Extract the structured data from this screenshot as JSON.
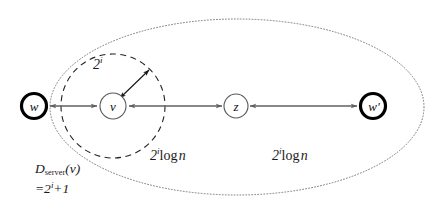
{
  "figure": {
    "colors": {
      "stroke_bold": "#000000",
      "stroke_thin": "#555555",
      "edge": "#606060",
      "dashed_circle": "#222222",
      "dotted_ellipse": "#7a7a7a",
      "text": "#111111",
      "background": "#ffffff"
    }
  },
  "nodes": [
    {
      "id": "w",
      "label": "w",
      "style": "bold",
      "cx": 34,
      "cy": 106,
      "r": 13
    },
    {
      "id": "v",
      "label": "v",
      "style": "thin",
      "cx": 113,
      "cy": 106,
      "r": 13
    },
    {
      "id": "z",
      "label": "z",
      "style": "thin",
      "cx": 236,
      "cy": 106,
      "r": 12
    },
    {
      "id": "wprime",
      "label": "w'",
      "style": "bold",
      "cx": 373,
      "cy": 106,
      "r": 13
    }
  ],
  "edges": [
    {
      "id": "w-to-v",
      "from": "w",
      "to": "v",
      "arrowheads": "both"
    },
    {
      "id": "v-from-z",
      "from": "z",
      "to": "v",
      "arrowheads": "both"
    },
    {
      "id": "wprime-to-z",
      "from": "wprime",
      "to": "z",
      "arrowheads": "both"
    }
  ],
  "labels": {
    "radius": {
      "base": "2",
      "exponent": "i"
    },
    "left_span": {
      "base": "2",
      "exponent": "i",
      "rest": "log",
      "variable": "n"
    },
    "right_span": {
      "base": "2",
      "exponent": "i",
      "rest": "log",
      "variable": "n"
    },
    "server_demand": {
      "name": "D",
      "subscript": "server",
      "argument": "(v)",
      "equals": "=2",
      "exponent": "i",
      "plus_one": "+1"
    }
  },
  "shapes": {
    "dashed_circle": {
      "cx": 113,
      "cy": 106,
      "r": 52,
      "style": "dashed"
    },
    "dotted_ellipse": {
      "cx": 237,
      "cy": 107,
      "rx": 187,
      "ry": 88,
      "style": "dotted"
    }
  }
}
